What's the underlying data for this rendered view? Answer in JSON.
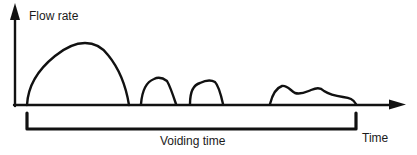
{
  "diagram": {
    "y_axis_label": "Flow rate",
    "x_axis_label": "Time",
    "bracket_label": "Voiding time",
    "ink_color": "#111111",
    "segments": [
      {
        "name": "flow-episode-1",
        "description": "large dome-shaped flow burst"
      },
      {
        "name": "flow-episode-2",
        "description": "small flow burst"
      },
      {
        "name": "flow-episode-3",
        "description": "small flow burst"
      },
      {
        "name": "flow-episode-4",
        "description": "low irregular prolonged flow"
      }
    ]
  }
}
